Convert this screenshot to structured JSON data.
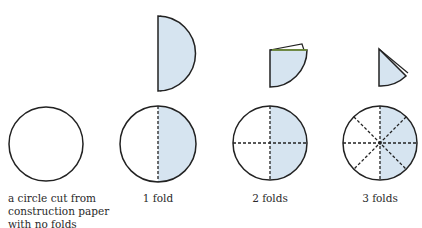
{
  "colors": {
    "fill": "#d6e4f0",
    "stroke": "#222222",
    "edge_green": "#8fbf3a",
    "text": "#2a2a2a"
  },
  "steps": [
    {
      "label_lines": [
        "a circle cut from",
        "construction paper",
        "with no folds"
      ],
      "folds": 0,
      "folded_shape": "none"
    },
    {
      "label": "1 fold",
      "folds": 1,
      "folded_shape": "half-circle"
    },
    {
      "label": "2 folds",
      "folds": 2,
      "folded_shape": "quarter-circle"
    },
    {
      "label": "3 folds",
      "folds": 3,
      "folded_shape": "eighth-circle"
    }
  ]
}
